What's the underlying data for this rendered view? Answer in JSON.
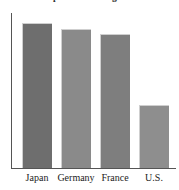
{
  "chart_data": {
    "type": "bar",
    "title": "Comparative Savings Rates",
    "xlabel": "",
    "ylabel": "",
    "categories": [
      "Japan",
      "Germany",
      "France",
      "U.S."
    ],
    "values": [
      94,
      90,
      87,
      41
    ],
    "ylim": [
      0,
      100
    ],
    "grid": false,
    "legend": null,
    "axis_tick_labels": {
      "x": [
        "Japan",
        "Germany",
        "France",
        "U.S."
      ],
      "y": []
    },
    "bar_colors": [
      "#6e6e6e",
      "#8a8a8a",
      "#7e7e7e",
      "#8e8e8e"
    ]
  },
  "figure": {
    "background_color": "#ffffff",
    "axis_color": "#555555"
  }
}
